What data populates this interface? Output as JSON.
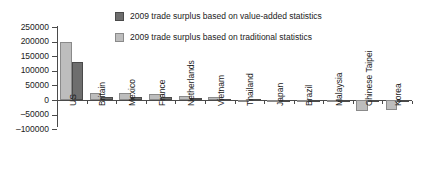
{
  "legend": {
    "position": "top-center",
    "items": [
      {
        "label": "2009 trade surplus based on value-added statistics",
        "swatch": "dark",
        "color": "#6e6e6e"
      },
      {
        "label": "2009 trade surplus based on traditional statistics",
        "swatch": "light",
        "color": "#bdbdbd"
      }
    ]
  },
  "axis": {
    "y_ticks": [
      "250000",
      "200000",
      "150000",
      "100000",
      "50000",
      "0",
      "-50000",
      "-100000"
    ],
    "x_labels": [
      "US",
      "Britain",
      "Mexico",
      "France",
      "Netherlands",
      "Vietnam",
      "Thailand",
      "Japan",
      "Brazil",
      "Malaysia",
      "Chinese Taipei",
      "Korea"
    ]
  },
  "chart_data": {
    "type": "bar",
    "title": "",
    "subtitle": "",
    "xlabel": "",
    "ylabel": "",
    "ylim": [
      -100000,
      250000
    ],
    "ytick_step": 50000,
    "grid": false,
    "legend_position": "top-center",
    "categories": [
      "US",
      "Britain",
      "Mexico",
      "France",
      "Netherlands",
      "Vietnam",
      "Thailand",
      "Japan",
      "Brazil",
      "Malaysia",
      "Chinese Taipei",
      "Korea"
    ],
    "series": [
      {
        "name": "2009 trade surplus based on traditional statistics",
        "color": "#bdbdbd",
        "values": [
          198000,
          25000,
          23000,
          21000,
          14000,
          11000,
          -3000,
          -3000,
          -3000,
          -6000,
          -36000,
          -34000
        ]
      },
      {
        "name": "2009 trade surplus based on value-added statistics",
        "color": "#6e6e6e",
        "values": [
          130000,
          11000,
          9000,
          9000,
          7000,
          4000,
          2000,
          1000,
          1000,
          1000,
          -4000,
          -3000
        ]
      }
    ]
  }
}
